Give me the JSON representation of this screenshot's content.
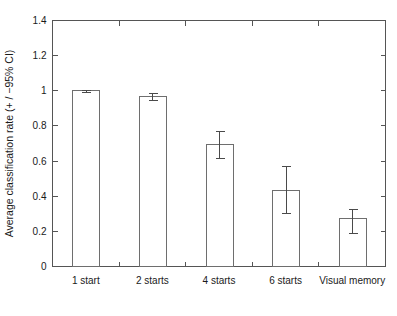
{
  "chart_data": {
    "type": "bar",
    "title": "",
    "xlabel": "",
    "ylabel": "Average classification rate (+ / −95% CI)",
    "categories": [
      "1 start",
      "2 starts",
      "4 starts",
      "6 starts",
      "Visual memory"
    ],
    "values": [
      1.0,
      0.965,
      0.695,
      0.435,
      0.275
    ],
    "errors_upper": [
      1.005,
      0.985,
      0.77,
      0.57,
      0.325
    ],
    "errors_lower": [
      0.995,
      0.945,
      0.62,
      0.305,
      0.19
    ],
    "error_label": "95% CI",
    "ylim": [
      0,
      1.4
    ],
    "ytick_values": [
      0,
      0.2,
      0.4,
      0.6,
      0.8,
      1,
      1.2,
      1.4
    ],
    "ytick_labels": [
      "0",
      "0.2",
      "0.4",
      "0.6",
      "0.8",
      "1",
      "1.2",
      "1.4"
    ],
    "grid": false,
    "legend": false,
    "bar_fill_color": "#ffffff",
    "bar_edge_color": "#6e6e6e",
    "axis_color": "#555555",
    "background_color": "#ffffff",
    "box_frame": true
  }
}
